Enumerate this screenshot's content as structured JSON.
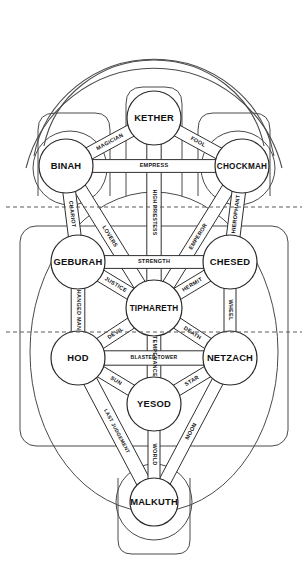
{
  "diagram": {
    "type": "kabbalistic-tree-with-tarot-paths",
    "background": "#ffffff",
    "line_color": "#3c3c3c",
    "text_color": "#111111"
  },
  "veils": [
    {
      "name": "veil-arc-outer"
    },
    {
      "name": "veil-arc-middle"
    },
    {
      "name": "veil-arc-inner"
    }
  ],
  "spheres": [
    {
      "id": "kether",
      "label": "KETHER",
      "cx": 154,
      "cy": 118,
      "r": 27,
      "halo": 0
    },
    {
      "id": "binah",
      "label": "BINAH",
      "cx": 66,
      "cy": 166,
      "r": 27,
      "halo": 37
    },
    {
      "id": "chockmah",
      "label": "CHOCKMAH",
      "cx": 242,
      "cy": 166,
      "r": 27,
      "halo": 37
    },
    {
      "id": "geburah",
      "label": "GEBURAH",
      "cx": 78,
      "cy": 262,
      "r": 27,
      "halo": 0
    },
    {
      "id": "chesed",
      "label": "CHESED",
      "cx": 230,
      "cy": 262,
      "r": 27,
      "halo": 0
    },
    {
      "id": "tiphareth",
      "label": "TIPHARETH",
      "cx": 154,
      "cy": 308,
      "r": 28,
      "halo": 0
    },
    {
      "id": "hod",
      "label": "HOD",
      "cx": 78,
      "cy": 358,
      "r": 27,
      "halo": 0
    },
    {
      "id": "netzach",
      "label": "NETZACH",
      "cx": 230,
      "cy": 358,
      "r": 27,
      "halo": 0
    },
    {
      "id": "yesod",
      "label": "YESOD",
      "cx": 154,
      "cy": 404,
      "r": 27,
      "halo": 0
    },
    {
      "id": "malkuth",
      "label": "MALKUTH",
      "cx": 154,
      "cy": 502,
      "r": 24,
      "halo": 38
    }
  ],
  "paths": [
    {
      "id": "fool",
      "label": "FOOL",
      "from": "kether",
      "to": "chockmah",
      "style": "band"
    },
    {
      "id": "magician",
      "label": "MAGICIAN",
      "from": "kether",
      "to": "binah",
      "style": "band"
    },
    {
      "id": "high-priestess",
      "label": "HIGH PRIESTESS",
      "from": "kether",
      "to": "tiphareth",
      "style": "band"
    },
    {
      "id": "empress",
      "label": "EMPRESS",
      "from": "binah",
      "to": "chockmah",
      "style": "band"
    },
    {
      "id": "emperor",
      "label": "EMPEROR",
      "from": "chockmah",
      "to": "tiphareth",
      "style": "band"
    },
    {
      "id": "hierophant",
      "label": "HIEROPHANT",
      "from": "chockmah",
      "to": "chesed",
      "style": "band"
    },
    {
      "id": "lovers",
      "label": "LOVERS",
      "from": "binah",
      "to": "tiphareth",
      "style": "band"
    },
    {
      "id": "chariot",
      "label": "CHARIOT",
      "from": "binah",
      "to": "geburah",
      "style": "band"
    },
    {
      "id": "strength",
      "label": "STRENGTH",
      "from": "geburah",
      "to": "chesed",
      "style": "band"
    },
    {
      "id": "hermit",
      "label": "HERMIT",
      "from": "chesed",
      "to": "tiphareth",
      "style": "band"
    },
    {
      "id": "wheel",
      "label": "WHEEL",
      "from": "chesed",
      "to": "netzach",
      "style": "band"
    },
    {
      "id": "justice",
      "label": "JUSTICE",
      "from": "geburah",
      "to": "tiphareth",
      "style": "band"
    },
    {
      "id": "hanged-man",
      "label": "HANGED MAN",
      "from": "geburah",
      "to": "hod",
      "style": "band"
    },
    {
      "id": "death",
      "label": "DEATH",
      "from": "tiphareth",
      "to": "netzach",
      "style": "band"
    },
    {
      "id": "devil",
      "label": "DEVIL",
      "from": "tiphareth",
      "to": "hod",
      "style": "band"
    },
    {
      "id": "temperance",
      "label": "TEMPERANCE",
      "from": "tiphareth",
      "to": "yesod",
      "style": "band"
    },
    {
      "id": "blasted-tower",
      "label": "BLASTED TOWER",
      "from": "hod",
      "to": "netzach",
      "style": "band"
    },
    {
      "id": "star",
      "label": "STAR",
      "from": "netzach",
      "to": "yesod",
      "style": "band"
    },
    {
      "id": "sun",
      "label": "SUN",
      "from": "hod",
      "to": "yesod",
      "style": "band"
    },
    {
      "id": "moon",
      "label": "MOON",
      "from": "netzach",
      "to": "malkuth",
      "style": "band"
    },
    {
      "id": "last-judgement",
      "label": "LAST JUDGEMENT",
      "from": "hod",
      "to": "malkuth",
      "style": "band"
    },
    {
      "id": "world",
      "label": "WORLD",
      "from": "yesod",
      "to": "malkuth",
      "style": "band"
    }
  ],
  "divisions": [
    {
      "id": "abyss",
      "y": 207,
      "style": "dashed"
    },
    {
      "id": "lower-veil",
      "y": 332,
      "style": "dashed"
    }
  ],
  "enclosures": [
    {
      "id": "pillar-severity-top",
      "shape": "rounded-rect"
    },
    {
      "id": "pillar-mercy-top",
      "shape": "rounded-rect"
    },
    {
      "id": "middle-pillar-top",
      "shape": "rounded-rect"
    },
    {
      "id": "world-of-creation",
      "shape": "rounded-rect"
    },
    {
      "id": "world-of-formation",
      "shape": "ellipse"
    },
    {
      "id": "malkuth-base",
      "shape": "rounded-rect"
    }
  ]
}
